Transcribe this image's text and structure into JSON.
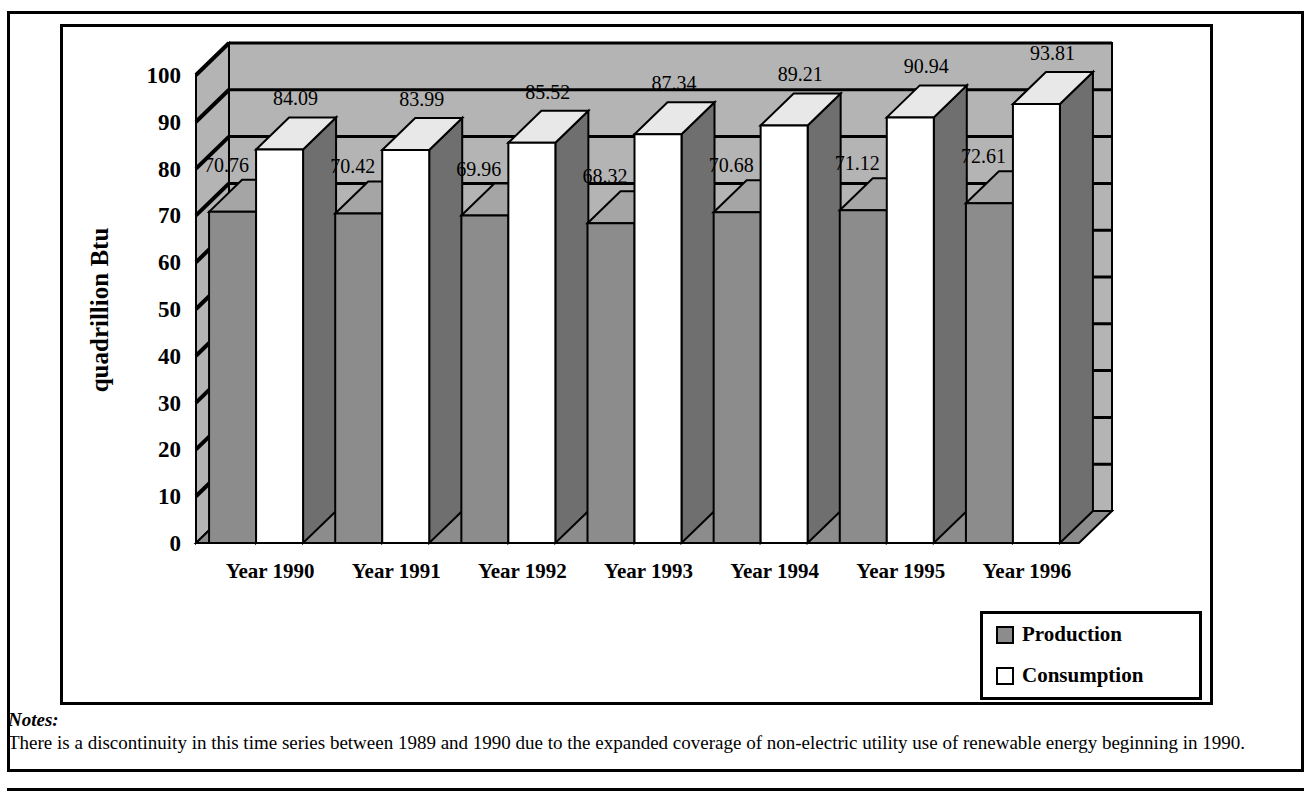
{
  "chart_data": {
    "type": "bar",
    "title": "",
    "subtitle": "",
    "xlabel": "",
    "ylabel": "quadrillion Btu",
    "ylim": [
      0,
      100
    ],
    "ytick_step": 10,
    "yticks": [
      "0",
      "10",
      "20",
      "30",
      "40",
      "50",
      "60",
      "70",
      "80",
      "90",
      "100"
    ],
    "categories": [
      "Year 1990",
      "Year 1991",
      "Year 1992",
      "Year 1993",
      "Year 1994",
      "Year 1995",
      "Year 1996"
    ],
    "series": [
      {
        "name": "Production",
        "color": "#8c8c8c",
        "values": [
          70.76,
          70.42,
          69.96,
          68.32,
          70.68,
          71.12,
          72.61
        ],
        "labels": [
          "70.76",
          "70.42",
          "69.96",
          "68.32",
          "70.68",
          "71.12",
          "72.61"
        ]
      },
      {
        "name": "Consumption",
        "color": "#ffffff",
        "values": [
          84.09,
          83.99,
          85.52,
          87.34,
          89.21,
          90.94,
          93.81
        ],
        "labels": [
          "84.09",
          "83.99",
          "85.52",
          "87.34",
          "89.21",
          "90.94",
          "93.81"
        ]
      }
    ],
    "legend_position": "bottom-right",
    "grid": true,
    "style": "3d-clustered-column",
    "wall_color": "#b4b4b4",
    "floor_color": "#8c8c8c",
    "gridline_color": "#000000"
  },
  "legend": {
    "items": [
      {
        "label": "Production",
        "swatch": "#8c8c8c"
      },
      {
        "label": "Consumption",
        "swatch": "#ffffff"
      }
    ]
  },
  "notes": {
    "title": "Notes:",
    "body": "There is a discontinuity in this time series between 1989 and 1990 due to the expanded coverage of non-electric utility use of renewable energy beginning in 1990."
  }
}
